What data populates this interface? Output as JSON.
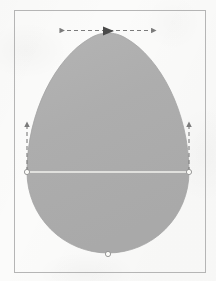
{
  "figure": {
    "title": "Egg oval geometric construction",
    "caption": "",
    "background_color": "#fbfbfa",
    "frame": {
      "name": "drawing-frame",
      "x": 14,
      "y": 10,
      "width": 191,
      "height": 262,
      "stroke_color": "#b5b5b5",
      "stroke_width": 1
    },
    "shape": {
      "name": "egg-oval",
      "fill_color": "#acacac",
      "stroke_color": "#a3a3a3",
      "center_x": 108,
      "apex_y": 33,
      "bottom_y": 256,
      "left_x": 27,
      "right_x": 189,
      "diameter_y": 172,
      "radius": 81
    },
    "construction_line": {
      "name": "horizontal-diameter-line",
      "x1": 27,
      "y1": 172,
      "x2": 189,
      "y2": 172,
      "color": "#f2f2ee",
      "stroke_width": 1.6
    },
    "markers": [
      {
        "name": "vertex-marker-left",
        "cx": 27,
        "cy": 172,
        "r": 2.6,
        "fill": "#fbfbf8",
        "stroke": "#8f8f8f"
      },
      {
        "name": "vertex-marker-right",
        "cx": 189,
        "cy": 172,
        "r": 2.6,
        "fill": "#fbfbf8",
        "stroke": "#8f8f8f"
      },
      {
        "name": "vertex-marker-bottom",
        "cx": 108,
        "cy": 254,
        "r": 2.6,
        "fill": "#fbfbf8",
        "stroke": "#8f8f8f"
      }
    ],
    "dimension_arrows": [
      {
        "name": "width-dimension-arrow",
        "orientation": "horizontal",
        "x1": 59,
        "y1": 31,
        "x2": 157,
        "y2": 31,
        "style": "dashed-double-headed",
        "color": "#7b7b7b",
        "dash": "4 3"
      },
      {
        "name": "left-height-dimension-arrow",
        "orientation": "vertical",
        "x1": 27,
        "y1": 172,
        "x2": 27,
        "y2": 121,
        "style": "dashed-single-headed-up",
        "color": "#7b7b7b",
        "dash": "4 3"
      },
      {
        "name": "right-height-dimension-arrow",
        "orientation": "vertical",
        "x1": 189,
        "y1": 172,
        "x2": 189,
        "y2": 121,
        "style": "dashed-single-headed-up",
        "color": "#7b7b7b",
        "dash": "4 3"
      }
    ],
    "center_marker": {
      "name": "apex-triangle-marker",
      "shape": "triangle-right",
      "cx": 108,
      "cy": 31,
      "size": 7,
      "fill": "#4a4a4a"
    }
  }
}
